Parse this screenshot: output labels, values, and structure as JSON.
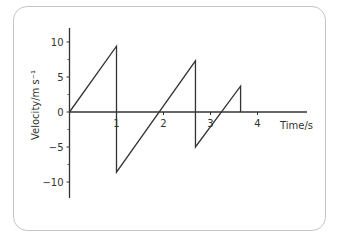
{
  "chart_data": {
    "type": "line",
    "title": "",
    "xlabel": "Time/s",
    "ylabel": "Velocity/m s⁻¹",
    "xlim": [
      0,
      5
    ],
    "ylim": [
      -12,
      12
    ],
    "xticks": [
      1,
      2,
      3,
      4
    ],
    "yticks": [
      10,
      5,
      0,
      -5,
      -10
    ],
    "ytick_labels": [
      "10",
      "5",
      "0",
      "−5",
      "−10"
    ],
    "grid": false,
    "legend": null,
    "series": [
      {
        "name": "velocity",
        "x": [
          0,
          1.0,
          1.0,
          2.68,
          2.68,
          3.64,
          3.64
        ],
        "y": [
          0,
          9.4,
          -8.6,
          7.3,
          -5.0,
          3.7,
          0
        ]
      }
    ],
    "line_color": "#333333"
  }
}
